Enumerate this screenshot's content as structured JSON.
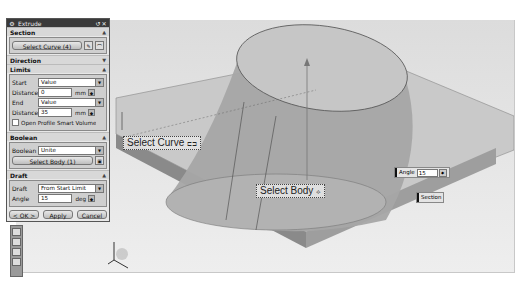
{
  "dialog": {
    "title": "Extrude",
    "title_icons": [
      "reset-icon",
      "close-icon"
    ],
    "sections": {
      "section": {
        "label": "Section",
        "select_curve_label": "Select Curve (4)"
      },
      "direction": {
        "label": "Direction"
      },
      "limits": {
        "label": "Limits",
        "start_label": "Start",
        "start_value": "Value",
        "start_distance_label": "Distance",
        "start_distance": "0",
        "end_label": "End",
        "end_value": "Value",
        "end_distance_label": "Distance",
        "end_distance": "35",
        "unit": "mm",
        "open_profile_label": "Open Profile Smart Volume"
      },
      "boolean": {
        "label": "Boolean",
        "boolean_label": "Boolean",
        "boolean_value": "Unite",
        "select_body_label": "Select Body (1)"
      },
      "draft": {
        "label": "Draft",
        "draft_label": "Draft",
        "draft_value": "From Start Limit",
        "angle_label": "Angle",
        "angle_value": "15",
        "angle_unit": "deg"
      }
    },
    "buttons": {
      "ok": "< OK >",
      "apply": "Apply",
      "cancel": "Cancel"
    }
  },
  "viewport": {
    "callouts": {
      "select_curve": "Select Curve",
      "select_body": "Select Body"
    },
    "angle_handle": {
      "label": "Angle",
      "value": "15"
    },
    "section_tag": "Section"
  },
  "colors": {
    "viewport_bg": "#e2e2e2",
    "solid_top": "#b9b9b9",
    "solid_side": "#8c8c8c",
    "dialog_bg": "#e8e8e8",
    "title_bar": "#3a3a3a"
  }
}
